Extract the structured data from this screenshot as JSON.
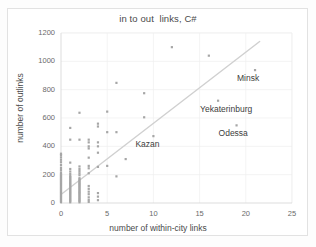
{
  "chart_data": {
    "type": "scatter",
    "title": "in to out  links, C#",
    "xlabel": "number of within-city links",
    "ylabel": "number of outlinks",
    "xlim": [
      0,
      25
    ],
    "ylim": [
      0,
      1200
    ],
    "xticks": [
      0,
      5,
      10,
      15,
      20,
      25
    ],
    "yticks": [
      0,
      200,
      400,
      600,
      800,
      1000,
      1200
    ],
    "grid": true,
    "legend": "none",
    "colors": {
      "point": "#a6a6a6",
      "trendline": "#d0d0d0",
      "grid": "#efefef",
      "axis": "#d9d9d9",
      "text": "#4a4a4a"
    },
    "trendline": {
      "x0": 0,
      "y0": 60,
      "x1": 21.5,
      "y1": 1140
    },
    "points": [
      {
        "x": 0,
        "y": 5
      },
      {
        "x": 0,
        "y": 12
      },
      {
        "x": 0,
        "y": 20
      },
      {
        "x": 0,
        "y": 28
      },
      {
        "x": 0,
        "y": 36
      },
      {
        "x": 0,
        "y": 44
      },
      {
        "x": 0,
        "y": 52
      },
      {
        "x": 0,
        "y": 60
      },
      {
        "x": 0,
        "y": 68
      },
      {
        "x": 0,
        "y": 76
      },
      {
        "x": 0,
        "y": 84
      },
      {
        "x": 0,
        "y": 92
      },
      {
        "x": 0,
        "y": 100
      },
      {
        "x": 0,
        "y": 108
      },
      {
        "x": 0,
        "y": 116
      },
      {
        "x": 0,
        "y": 124
      },
      {
        "x": 0,
        "y": 132
      },
      {
        "x": 0,
        "y": 140
      },
      {
        "x": 0,
        "y": 148
      },
      {
        "x": 0,
        "y": 156
      },
      {
        "x": 0,
        "y": 164
      },
      {
        "x": 0,
        "y": 172
      },
      {
        "x": 0,
        "y": 180
      },
      {
        "x": 0,
        "y": 188
      },
      {
        "x": 0,
        "y": 196
      },
      {
        "x": 0,
        "y": 204
      },
      {
        "x": 0,
        "y": 215
      },
      {
        "x": 0,
        "y": 232
      },
      {
        "x": 0,
        "y": 248
      },
      {
        "x": 0,
        "y": 268
      },
      {
        "x": 0,
        "y": 288
      },
      {
        "x": 0,
        "y": 305
      },
      {
        "x": 0,
        "y": 322
      },
      {
        "x": 0,
        "y": 338
      },
      {
        "x": 0,
        "y": 348
      },
      {
        "x": 1,
        "y": 5
      },
      {
        "x": 1,
        "y": 14
      },
      {
        "x": 1,
        "y": 22
      },
      {
        "x": 1,
        "y": 30
      },
      {
        "x": 1,
        "y": 38
      },
      {
        "x": 1,
        "y": 46
      },
      {
        "x": 1,
        "y": 54
      },
      {
        "x": 1,
        "y": 62
      },
      {
        "x": 1,
        "y": 70
      },
      {
        "x": 1,
        "y": 78
      },
      {
        "x": 1,
        "y": 86
      },
      {
        "x": 1,
        "y": 94
      },
      {
        "x": 1,
        "y": 102
      },
      {
        "x": 1,
        "y": 110
      },
      {
        "x": 1,
        "y": 118
      },
      {
        "x": 1,
        "y": 126
      },
      {
        "x": 1,
        "y": 134
      },
      {
        "x": 1,
        "y": 142
      },
      {
        "x": 1,
        "y": 150
      },
      {
        "x": 1,
        "y": 158
      },
      {
        "x": 1,
        "y": 166
      },
      {
        "x": 1,
        "y": 174
      },
      {
        "x": 1,
        "y": 182
      },
      {
        "x": 1,
        "y": 190
      },
      {
        "x": 1,
        "y": 205
      },
      {
        "x": 1,
        "y": 222
      },
      {
        "x": 1,
        "y": 240
      },
      {
        "x": 1,
        "y": 285
      },
      {
        "x": 1,
        "y": 447
      },
      {
        "x": 1,
        "y": 530
      },
      {
        "x": 2,
        "y": 5
      },
      {
        "x": 2,
        "y": 14
      },
      {
        "x": 2,
        "y": 22
      },
      {
        "x": 2,
        "y": 30
      },
      {
        "x": 2,
        "y": 38
      },
      {
        "x": 2,
        "y": 46
      },
      {
        "x": 2,
        "y": 54
      },
      {
        "x": 2,
        "y": 62
      },
      {
        "x": 2,
        "y": 70
      },
      {
        "x": 2,
        "y": 78
      },
      {
        "x": 2,
        "y": 86
      },
      {
        "x": 2,
        "y": 94
      },
      {
        "x": 2,
        "y": 102
      },
      {
        "x": 2,
        "y": 110
      },
      {
        "x": 2,
        "y": 118
      },
      {
        "x": 2,
        "y": 126
      },
      {
        "x": 2,
        "y": 134
      },
      {
        "x": 2,
        "y": 142
      },
      {
        "x": 2,
        "y": 150
      },
      {
        "x": 2,
        "y": 158
      },
      {
        "x": 2,
        "y": 166
      },
      {
        "x": 2,
        "y": 175
      },
      {
        "x": 2,
        "y": 196
      },
      {
        "x": 2,
        "y": 210
      },
      {
        "x": 2,
        "y": 225
      },
      {
        "x": 2,
        "y": 240
      },
      {
        "x": 2,
        "y": 258
      },
      {
        "x": 2,
        "y": 447
      },
      {
        "x": 2,
        "y": 637
      },
      {
        "x": 3,
        "y": 8
      },
      {
        "x": 3,
        "y": 22
      },
      {
        "x": 3,
        "y": 40
      },
      {
        "x": 3,
        "y": 62
      },
      {
        "x": 3,
        "y": 80
      },
      {
        "x": 3,
        "y": 100
      },
      {
        "x": 3,
        "y": 120
      },
      {
        "x": 3,
        "y": 210
      },
      {
        "x": 3,
        "y": 245
      },
      {
        "x": 3,
        "y": 262
      },
      {
        "x": 3,
        "y": 320
      },
      {
        "x": 3,
        "y": 385
      },
      {
        "x": 3,
        "y": 400
      },
      {
        "x": 3,
        "y": 428
      },
      {
        "x": 3,
        "y": 447
      },
      {
        "x": 4,
        "y": 20
      },
      {
        "x": 4,
        "y": 45
      },
      {
        "x": 4,
        "y": 70
      },
      {
        "x": 4,
        "y": 255
      },
      {
        "x": 4,
        "y": 355
      },
      {
        "x": 4,
        "y": 400
      },
      {
        "x": 4,
        "y": 428
      },
      {
        "x": 4,
        "y": 540
      },
      {
        "x": 4,
        "y": 560
      },
      {
        "x": 5,
        "y": 262
      },
      {
        "x": 5,
        "y": 500
      },
      {
        "x": 5,
        "y": 645
      },
      {
        "x": 6,
        "y": 188
      },
      {
        "x": 6,
        "y": 500
      },
      {
        "x": 6,
        "y": 848
      },
      {
        "x": 7,
        "y": 310
      },
      {
        "x": 9,
        "y": 605
      },
      {
        "x": 9,
        "y": 775
      },
      {
        "x": 10,
        "y": 472,
        "label": "Kazan"
      },
      {
        "x": 12,
        "y": 1100
      },
      {
        "x": 16,
        "y": 1040
      },
      {
        "x": 17,
        "y": 722,
        "label": "Yekaterinburg"
      },
      {
        "x": 19,
        "y": 548,
        "label": "Odessa"
      },
      {
        "x": 21,
        "y": 938,
        "label": "Minsk"
      }
    ],
    "annotations": [
      {
        "text": "Kazan",
        "x": 10,
        "y": 472
      },
      {
        "text": "Yekaterinburg",
        "x": 17,
        "y": 722
      },
      {
        "text": "Odessa",
        "x": 19,
        "y": 548
      },
      {
        "text": "Minsk",
        "x": 21,
        "y": 938
      }
    ]
  }
}
